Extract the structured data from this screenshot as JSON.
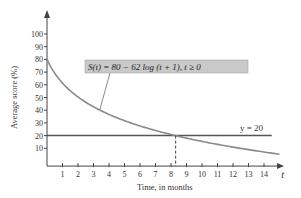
{
  "chart_data": {
    "type": "line",
    "title": "",
    "xlabel": "Time, in months",
    "ylabel": "Average score (%)",
    "x_axis_variable": "t",
    "xlim": [
      0,
      15
    ],
    "ylim": [
      0,
      105
    ],
    "x_ticks": [
      1,
      2,
      3,
      4,
      5,
      6,
      7,
      8,
      9,
      10,
      11,
      12,
      13,
      14
    ],
    "x_tick_labels": [
      "1",
      "2",
      "3",
      "4",
      "5",
      "6",
      "7",
      "8",
      "9",
      "10",
      "11",
      "12",
      "13",
      "14"
    ],
    "y_ticks": [
      10,
      20,
      30,
      40,
      50,
      60,
      70,
      80,
      90,
      100
    ],
    "y_tick_labels": [
      "10",
      "20",
      "30",
      "40",
      "50",
      "60",
      "70",
      "80",
      "90",
      "100"
    ],
    "grid": false,
    "series": [
      {
        "name": "S(t) = 80 − 62 log (t + 1), t ≥ 0",
        "kind": "function",
        "formula": "80 - 62*log10(t+1)",
        "domain": [
          0,
          15
        ],
        "color": "#8a8a8a"
      },
      {
        "name": "y = 20",
        "kind": "horizontal",
        "y": 20,
        "domain": [
          0,
          14.5
        ],
        "color": "#555555"
      }
    ],
    "annotations": [
      {
        "text": "S(t) = 80 − 62 log (t + 1), t ≥ 0",
        "box_color": "#c8c8c8",
        "points_to_t": 3.4
      },
      {
        "text": "y = 20",
        "near": "right end of horizontal line"
      },
      {
        "type": "dashed-vertical",
        "x": 8.3,
        "from_y": 0,
        "to_y": 20
      }
    ]
  }
}
